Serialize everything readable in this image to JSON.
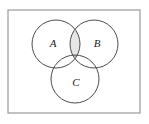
{
  "figure": {
    "type": "venn-diagram",
    "universal_set": {
      "shape": "rectangle",
      "label": "",
      "x": 8,
      "y": 10,
      "width": 132,
      "height": 103,
      "stroke": "#9a9a9a",
      "fill": "#ffffff",
      "stroke_width": 1.2
    },
    "circles": [
      {
        "id": "A",
        "label": "A",
        "cx": 56,
        "cy": 44,
        "r": 24,
        "label_x": 53,
        "label_y": 44,
        "stroke": "#4d4d4d",
        "fill": "none"
      },
      {
        "id": "B",
        "label": "B",
        "cx": 94,
        "cy": 44,
        "r": 24,
        "label_x": 97,
        "label_y": 44,
        "stroke": "#4d4d4d",
        "fill": "none"
      },
      {
        "id": "C",
        "label": "C",
        "cx": 75,
        "cy": 79,
        "r": 24,
        "label_x": 76,
        "label_y": 83,
        "stroke": "#4d4d4d",
        "fill": "none"
      }
    ],
    "shaded_regions": [
      {
        "id": "A-and-B",
        "name": "intersection-a-b",
        "fill": "#e6e6e6"
      },
      {
        "id": "A-and-B-and-C",
        "name": "intersection-a-b-c",
        "fill": "#c9c9c9"
      }
    ],
    "colors": {
      "circle_stroke": "#4d4d4d",
      "rect_stroke": "#9a9a9a",
      "label_color": "#1a1a1a",
      "background": "#ffffff",
      "shade_light": "#e6e6e6",
      "shade_dark": "#c9c9c9"
    }
  }
}
